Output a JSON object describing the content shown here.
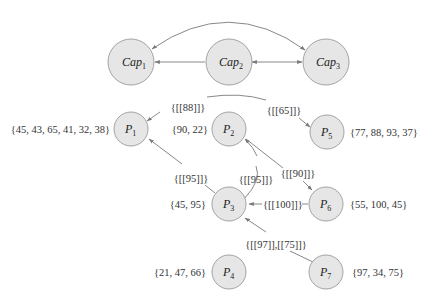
{
  "colors": {
    "node_fill": "#e6e6e6",
    "node_stroke": "#9a9a9a",
    "edge": "#7a7a7a",
    "text": "#333333"
  },
  "capabilities": [
    {
      "id": "Cap1",
      "base": "Cap",
      "sub": "1"
    },
    {
      "id": "Cap2",
      "base": "Cap",
      "sub": "2"
    },
    {
      "id": "Cap3",
      "base": "Cap",
      "sub": "3"
    }
  ],
  "processes": [
    {
      "id": "P1",
      "base": "P",
      "sub": "1",
      "set": "{45, 43, 65, 41, 32, 38}"
    },
    {
      "id": "P2",
      "base": "P",
      "sub": "2",
      "set": "{90, 22}"
    },
    {
      "id": "P3",
      "base": "P",
      "sub": "3",
      "set": "{45, 95}"
    },
    {
      "id": "P4",
      "base": "P",
      "sub": "4",
      "set": "{21, 47, 66}"
    },
    {
      "id": "P5",
      "base": "P",
      "sub": "5",
      "set": "{77, 88, 93, 37}"
    },
    {
      "id": "P6",
      "base": "P",
      "sub": "6",
      "set": "{55, 100, 45}"
    },
    {
      "id": "P7",
      "base": "P",
      "sub": "7",
      "set": "{97, 34, 75}"
    }
  ],
  "edges": [
    {
      "from": "Cap2",
      "to": "Cap1",
      "label": ""
    },
    {
      "from": "Cap2",
      "to": "Cap3",
      "label": "",
      "bidirectional": true
    },
    {
      "from": "Cap3",
      "to": "Cap1",
      "label": "",
      "bidirectional": true,
      "curved": true
    },
    {
      "from": "P5",
      "to": "P1",
      "label": "{[[88]]}"
    },
    {
      "from": "P1",
      "to": "P5",
      "label": "{[[65]]}"
    },
    {
      "from": "P3",
      "to": "P1",
      "label": "{[[95]]}"
    },
    {
      "from": "P3",
      "to": "P2",
      "label": "{[[95]]}"
    },
    {
      "from": "P2",
      "to": "P6",
      "label": "{[[90]]}"
    },
    {
      "from": "P6",
      "to": "P3",
      "label": "{[[100]]}"
    },
    {
      "from": "P7",
      "to": "P3",
      "label": "{[[97]],[[75]]}"
    }
  ]
}
